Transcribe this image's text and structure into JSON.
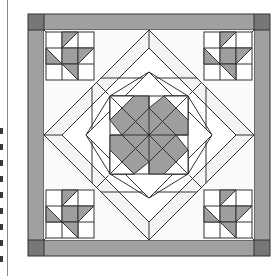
{
  "page": {
    "background_color": "#ffffff",
    "margin_rule_color": "#8a8a8a",
    "margin_mark_color": "#3a3a3a",
    "margin_mark_offsets": [
      0,
      16,
      32,
      48,
      64,
      80,
      96,
      112,
      128
    ]
  },
  "figure": {
    "line_color": "#333333",
    "background_color": "#ffffff",
    "fill_light": "#f7f7f7",
    "fill_white": "#ffffff",
    "fill_gray": "#9e9e9e",
    "fill_border": "#a0a0a0",
    "fill_corner_square": "#777777",
    "stroke_width": "1",
    "outer_frame": {
      "x": 14,
      "y": 14,
      "size": 242
    },
    "border_width": 16,
    "geometry_notes": {
      "inner_field": {
        "x": 30,
        "y": 30,
        "size": 210
      },
      "corner_block_size": 48,
      "diamond_outer_radius": 105,
      "diamond_mid_radius": 68,
      "diamond_inner_radius": 42,
      "center": {
        "x": 135,
        "y": 135
      }
    },
    "chart_data": {
      "type": "table",
      "title": "Quilt Block Diagram",
      "categories": [
        "outer-border",
        "border-corner-squares",
        "corner-star-blocks",
        "outer-diamond-frame",
        "mid-diamond-frame",
        "center-pinwheel-star"
      ],
      "values": [
        1,
        4,
        4,
        1,
        1,
        1
      ],
      "xlabel": "component",
      "ylabel": "count",
      "legend": [
        {
          "label": "Gray fabric",
          "color": "#9e9e9e"
        },
        {
          "label": "Dark corner fabric",
          "color": "#777777"
        },
        {
          "label": "Background fabric",
          "color": "#f7f7f7"
        }
      ]
    }
  }
}
